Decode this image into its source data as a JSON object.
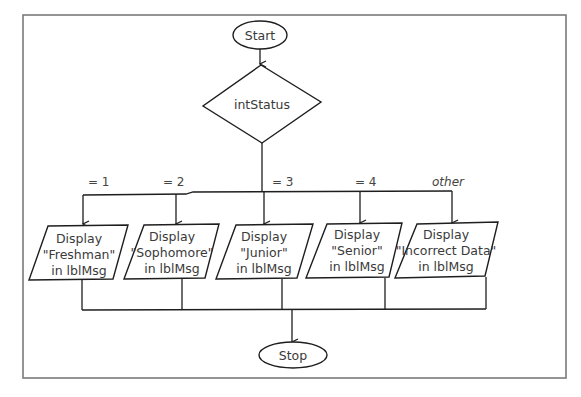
{
  "diagram": {
    "type": "flowchart",
    "start": {
      "label": "Start"
    },
    "decision": {
      "label": "intStatus"
    },
    "branches": [
      {
        "condition": "= 1",
        "lines": [
          "Display",
          "\"Freshman\"",
          "in lblMsg"
        ]
      },
      {
        "condition": "= 2",
        "lines": [
          "Display",
          "\"Sophomore\"",
          "in lblMsg"
        ]
      },
      {
        "condition": "= 3",
        "lines": [
          "Display",
          "\"Junior\"",
          "in lblMsg"
        ]
      },
      {
        "condition": "= 4",
        "lines": [
          "Display",
          "\"Senior\"",
          "in lblMsg"
        ]
      },
      {
        "condition": "other",
        "lines": [
          "Display",
          "\"Incorrect Data\"",
          "in lblMsg"
        ]
      }
    ],
    "stop": {
      "label": "Stop"
    }
  },
  "colors": {
    "stroke": "#1e1e1e",
    "text": "#3a3a3a",
    "frame": "#7a7a7a",
    "background": "#ffffff"
  }
}
